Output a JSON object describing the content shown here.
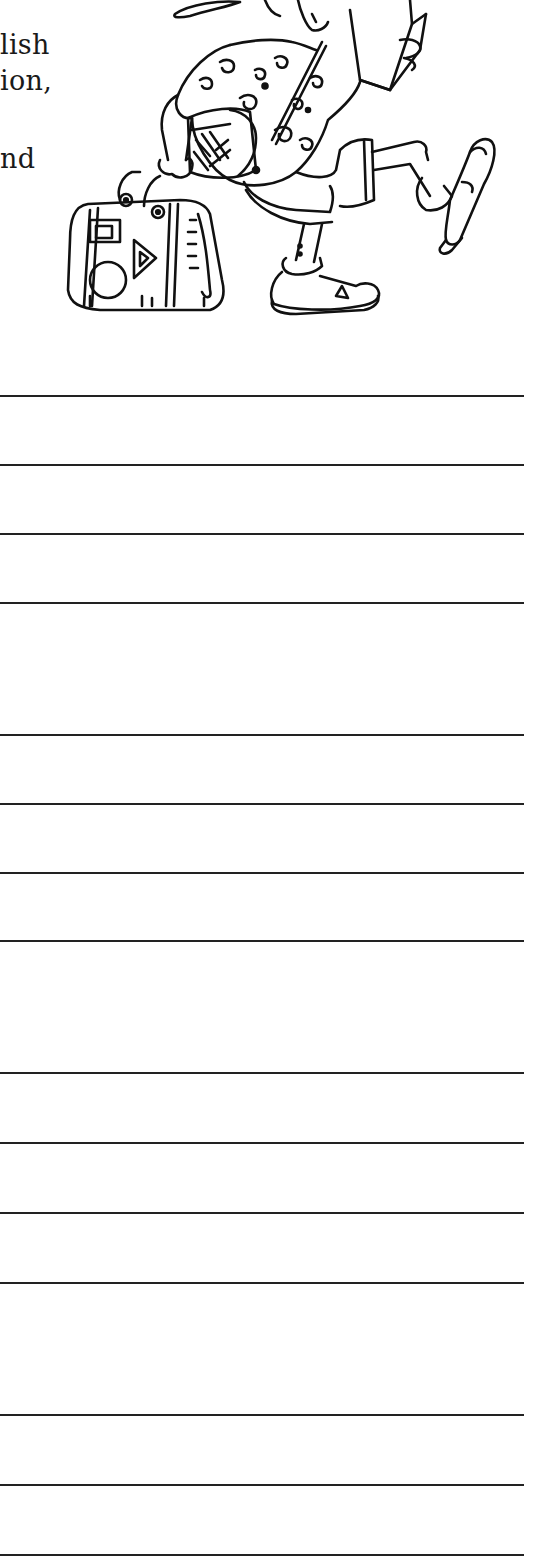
{
  "document": {
    "text_fragments": [
      {
        "text": "lish",
        "top": 31
      },
      {
        "text": "ion,",
        "top": 67
      },
      {
        "text": "nd",
        "top": 145
      }
    ],
    "illustration": {
      "subject": "cartoon tourist in patterned shirt and shorts, reading a book, carrying a handbag, wearing sandals"
    },
    "writing_lines": {
      "color": "#222222",
      "groups": [
        {
          "positions": [
            395,
            464,
            533,
            602
          ]
        },
        {
          "positions": [
            734,
            803,
            872,
            940
          ]
        },
        {
          "positions": [
            1072,
            1142,
            1212,
            1282
          ]
        },
        {
          "positions": [
            1414,
            1484,
            1554
          ]
        }
      ]
    }
  }
}
